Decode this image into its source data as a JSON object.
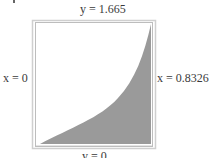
{
  "diagram": {
    "labels": {
      "top": "y = 1.665",
      "left": "x = 0",
      "right": "x = 0.8326",
      "bottom": "y = 0"
    },
    "colors": {
      "fill": "#9a9a9a",
      "frame": "#c8c8c8",
      "background": "#ffffff"
    },
    "region": {
      "shape": "area under increasing convex curve",
      "x_range": [
        0,
        0.8326
      ],
      "y_range": [
        0,
        1.665
      ]
    }
  }
}
